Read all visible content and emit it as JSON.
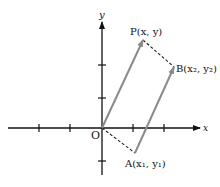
{
  "diagram": {
    "type": "vector-coordinate-diagram",
    "axes": {
      "x_label": "x",
      "y_label": "y",
      "origin_label": "O"
    },
    "points": {
      "P": {
        "label": "P(x, y)"
      },
      "B": {
        "label": "B(x₂, y₂)"
      },
      "A": {
        "label": "A(x₁, y₁)"
      }
    },
    "colors": {
      "axis": "#111111",
      "vector": "#8a8a8a",
      "dashed": "#222222",
      "background": "#ffffff"
    }
  }
}
